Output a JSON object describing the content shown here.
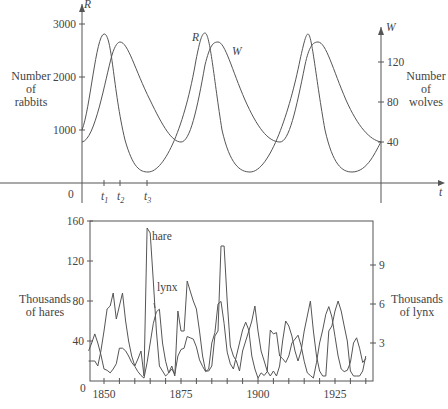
{
  "chart_data": [
    {
      "type": "line",
      "title": "",
      "description": "Predator-prey model: rabbits R(t) and wolves W(t)",
      "xlabel": "t",
      "x_ticks": [
        "0",
        "t1",
        "t2",
        "t3"
      ],
      "left_axis": {
        "symbol": "R",
        "label": "Number of rabbits",
        "ticks": [
          1000,
          2000,
          3000
        ]
      },
      "right_axis": {
        "symbol": "W",
        "label": "Number of wolves",
        "ticks": [
          40,
          80,
          120
        ]
      },
      "series": [
        {
          "name": "R",
          "label": "R",
          "peak": 2800,
          "trough": 200,
          "initial": 1000
        },
        {
          "name": "W",
          "label": "W",
          "peak": 135,
          "trough": 40,
          "initial": 40
        }
      ],
      "grid": false
    },
    {
      "type": "line",
      "title": "",
      "xlabel": "",
      "x_ticks": [
        1850,
        1875,
        1900,
        1925
      ],
      "xlim": [
        1845,
        1935
      ],
      "left_axis": {
        "label": "Thousands of hares",
        "ticks": [
          0,
          40,
          80,
          120,
          160
        ],
        "ylim": [
          0,
          160
        ]
      },
      "right_axis": {
        "label": "Thousands of lynx",
        "ticks": [
          3,
          6,
          9
        ],
        "ylim": [
          0,
          12
        ]
      },
      "grid": false,
      "series": [
        {
          "name": "hare",
          "axis": "left",
          "x": [
            1845,
            1846,
            1847,
            1848,
            1849,
            1850,
            1851,
            1852,
            1853,
            1854,
            1855,
            1856,
            1857,
            1858,
            1859,
            1860,
            1861,
            1862,
            1863,
            1864,
            1865,
            1866,
            1867,
            1868,
            1869,
            1870,
            1871,
            1872,
            1873,
            1874,
            1875,
            1876,
            1877,
            1878,
            1879,
            1880,
            1881,
            1882,
            1883,
            1884,
            1885,
            1886,
            1887,
            1888,
            1889,
            1890,
            1891,
            1892,
            1893,
            1894,
            1895,
            1896,
            1897,
            1898,
            1899,
            1900,
            1901,
            1902,
            1903,
            1904,
            1905,
            1906,
            1907,
            1908,
            1909,
            1910,
            1911,
            1912,
            1913,
            1914,
            1915,
            1916,
            1917,
            1918,
            1919,
            1920,
            1921,
            1922,
            1923,
            1924,
            1925,
            1926,
            1927,
            1928,
            1929,
            1930,
            1931,
            1932,
            1933,
            1934,
            1935
          ],
          "values": [
            20,
            20,
            20,
            15,
            30,
            50,
            72,
            75,
            88,
            62,
            75,
            88,
            60,
            40,
            25,
            15,
            22,
            30,
            5,
            153,
            148,
            100,
            50,
            15,
            10,
            5,
            8,
            15,
            5,
            70,
            50,
            50,
            100,
            90,
            80,
            72,
            50,
            25,
            10,
            10,
            15,
            45,
            50,
            135,
            135,
            80,
            35,
            25,
            20,
            10,
            30,
            40,
            50,
            60,
            75,
            50,
            30,
            20,
            10,
            5,
            10,
            5,
            15,
            40,
            60,
            55,
            45,
            30,
            20,
            30,
            50,
            65,
            80,
            50,
            25,
            10,
            5,
            5,
            50,
            55,
            70,
            80,
            70,
            55,
            40,
            10,
            5,
            5,
            5,
            10,
            25
          ]
        },
        {
          "name": "lynx",
          "axis": "right",
          "x": [
            1845,
            1846,
            1847,
            1848,
            1849,
            1850,
            1851,
            1852,
            1853,
            1854,
            1855,
            1856,
            1857,
            1858,
            1859,
            1860,
            1861,
            1862,
            1863,
            1864,
            1865,
            1866,
            1867,
            1868,
            1869,
            1870,
            1871,
            1872,
            1873,
            1874,
            1875,
            1876,
            1877,
            1878,
            1879,
            1880,
            1881,
            1882,
            1883,
            1884,
            1885,
            1886,
            1887,
            1888,
            1889,
            1890,
            1891,
            1892,
            1893,
            1894,
            1895,
            1896,
            1897,
            1898,
            1899,
            1900,
            1901,
            1902,
            1903,
            1904,
            1905,
            1906,
            1907,
            1908,
            1909,
            1910,
            1911,
            1912,
            1913,
            1914,
            1915,
            1916,
            1917,
            1918,
            1919,
            1920,
            1921,
            1922,
            1923,
            1924,
            1925,
            1926,
            1927,
            1928,
            1929,
            1930,
            1931,
            1932,
            1933,
            1934,
            1935
          ],
          "values": [
            2.4,
            3,
            3.7,
            3,
            2.1,
            1,
            0.9,
            0.7,
            1,
            1.4,
            2.6,
            2.6,
            2.4,
            2,
            1.5,
            1.2,
            0.8,
            0.5,
            0.3,
            1.5,
            3,
            4.5,
            5.4,
            5.6,
            3,
            1.6,
            0.7,
            1,
            0.6,
            2,
            2.5,
            2.6,
            3.5,
            3.4,
            3.3,
            2.7,
            1.7,
            1.2,
            0.8,
            1,
            3,
            3.8,
            6,
            6.2,
            4.5,
            2.3,
            1.4,
            1,
            2,
            3,
            4,
            4.6,
            4,
            2,
            1,
            0.3,
            0.7,
            0.5,
            0.8,
            4,
            3.7,
            3.8,
            2,
            1.8,
            1.5,
            2,
            3,
            3.3,
            3.6,
            2.8,
            1.6,
            0.7,
            0.5,
            0.3,
            1.5,
            3,
            4,
            5.2,
            5.8,
            5,
            3.5,
            2,
            1,
            0.8,
            0.9,
            1.5,
            3,
            3.4,
            2.6,
            1.5,
            1.8
          ]
        }
      ],
      "annotations": [
        "hare",
        "lynx"
      ]
    }
  ],
  "top": {
    "left_symbol": "R",
    "right_symbol": "W",
    "t_symbol": "t",
    "origin": "0",
    "t1": "t",
    "t1_sub": "1",
    "t2": "t",
    "t2_sub": "2",
    "t3": "t",
    "t3_sub": "3",
    "left_ticks": [
      "3000",
      "2000",
      "1000"
    ],
    "right_ticks": [
      "120",
      "80",
      "40"
    ],
    "left_label": [
      "Number",
      "of",
      "rabbits"
    ],
    "right_label": [
      "Number",
      "of",
      "wolves"
    ],
    "r_label": "R",
    "w_label": "W"
  },
  "bottom": {
    "left_ticks": [
      "160",
      "120",
      "80",
      "40"
    ],
    "origin": "0",
    "right_ticks": [
      "9",
      "6",
      "3"
    ],
    "x_ticks": [
      "1850",
      "1875",
      "1900",
      "1925"
    ],
    "left_label": [
      "Thousands",
      "of hares"
    ],
    "right_label": [
      "Thousands",
      "of lynx"
    ],
    "hare_label": "hare",
    "lynx_label": "lynx"
  },
  "colors": {
    "line": "#555555",
    "text": "#444444",
    "axis": "#555555"
  }
}
